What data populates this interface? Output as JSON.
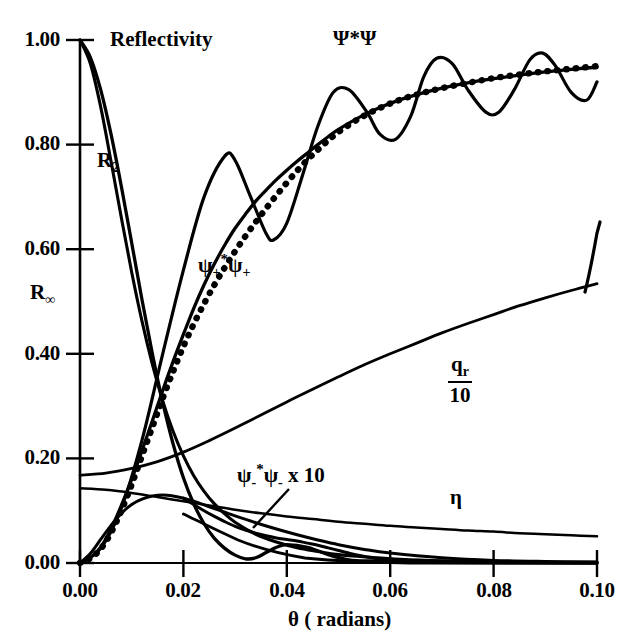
{
  "figure": {
    "background": "#ffffff",
    "ink": "#000000"
  },
  "axes": {
    "y_title": "Reflectivity",
    "x_title": "θ ( radians)",
    "y_ticks": [
      "0.00",
      "0.20",
      "0.40",
      "0.60",
      "0.80",
      "1.00"
    ],
    "x_ticks": [
      "0.00",
      "0.02",
      "0.04",
      "0.06",
      "0.08",
      "0.10"
    ]
  },
  "curve_labels": {
    "psi_star_psi": "Ψ*Ψ",
    "psi_plus": {
      "base1": "ψ",
      "sub1": "+",
      "star": "*",
      "base2": "ψ",
      "sub2": "+"
    },
    "psi_minus": {
      "base1": "ψ",
      "sub1": "-",
      "star": "*",
      "base2": "ψ",
      "sub2": "-",
      "tail": " x 10"
    },
    "r2": {
      "base": "R",
      "sub": "2"
    },
    "rinf": {
      "base": "R",
      "sub": "∞"
    },
    "qr": {
      "num": "q",
      "num_sub": "r",
      "den": "10"
    },
    "eta": "η"
  },
  "chart_data": {
    "type": "line",
    "title": "Reflectivity",
    "xlabel": "θ ( radians)",
    "ylabel": "Reflectivity",
    "xlim": [
      0.0,
      0.1
    ],
    "ylim": [
      0.0,
      1.0
    ],
    "xticks": [
      0.0,
      0.02,
      0.04,
      0.06,
      0.08,
      0.1
    ],
    "yticks": [
      0.0,
      0.2,
      0.4,
      0.6,
      0.8,
      1.0
    ],
    "grid": false,
    "legend": "inline-annotations",
    "series": [
      {
        "name": "R_2",
        "style": "solid",
        "x": [
          0.0,
          0.002,
          0.004,
          0.006,
          0.008,
          0.01,
          0.012,
          0.014,
          0.016,
          0.018,
          0.02,
          0.022,
          0.024,
          0.026,
          0.028,
          0.03,
          0.032,
          0.034,
          0.036,
          0.038,
          0.04,
          0.044,
          0.048,
          0.052,
          0.056,
          0.06,
          0.07,
          0.08,
          0.09,
          0.1
        ],
        "y": [
          1.0,
          0.967,
          0.905,
          0.82,
          0.72,
          0.612,
          0.503,
          0.4,
          0.307,
          0.228,
          0.163,
          0.113,
          0.075,
          0.047,
          0.028,
          0.015,
          0.008,
          0.01,
          0.02,
          0.03,
          0.035,
          0.03,
          0.016,
          0.006,
          0.004,
          0.005,
          0.003,
          0.002,
          0.001,
          0.001
        ]
      },
      {
        "name": "R_infinity",
        "style": "solid",
        "x": [
          0.0,
          0.002,
          0.004,
          0.006,
          0.008,
          0.01,
          0.012,
          0.014,
          0.016,
          0.018,
          0.02,
          0.022,
          0.024,
          0.026,
          0.028,
          0.03,
          0.034,
          0.038,
          0.042,
          0.046,
          0.05,
          0.056,
          0.062,
          0.07,
          0.08,
          0.09,
          0.1
        ],
        "y": [
          1.0,
          0.955,
          0.872,
          0.768,
          0.66,
          0.556,
          0.462,
          0.38,
          0.31,
          0.252,
          0.205,
          0.167,
          0.137,
          0.113,
          0.094,
          0.078,
          0.055,
          0.04,
          0.029,
          0.022,
          0.016,
          0.011,
          0.007,
          0.004,
          0.002,
          0.001,
          0.001
        ]
      },
      {
        "name": "psi_plus_star_psi_plus_solid",
        "style": "solid",
        "x": [
          0.0,
          0.002,
          0.004,
          0.006,
          0.008,
          0.01,
          0.012,
          0.014,
          0.016,
          0.018,
          0.02,
          0.022,
          0.024,
          0.026,
          0.028,
          0.03,
          0.032,
          0.034,
          0.036,
          0.038,
          0.04,
          0.042,
          0.044,
          0.046,
          0.048,
          0.05,
          0.054,
          0.058,
          0.062,
          0.066,
          0.07,
          0.075,
          0.08,
          0.085,
          0.09,
          0.095,
          0.1
        ],
        "y": [
          0.0,
          0.01,
          0.03,
          0.065,
          0.11,
          0.16,
          0.215,
          0.272,
          0.33,
          0.385,
          0.437,
          0.487,
          0.532,
          0.572,
          0.608,
          0.64,
          0.667,
          0.692,
          0.713,
          0.733,
          0.751,
          0.768,
          0.784,
          0.8,
          0.815,
          0.829,
          0.852,
          0.871,
          0.886,
          0.898,
          0.908,
          0.918,
          0.926,
          0.933,
          0.939,
          0.944,
          0.948
        ]
      },
      {
        "name": "psi_plus_star_psi_plus_dotted",
        "style": "dotted",
        "x": [
          0.0,
          0.002,
          0.004,
          0.006,
          0.008,
          0.01,
          0.012,
          0.014,
          0.016,
          0.018,
          0.02,
          0.022,
          0.024,
          0.026,
          0.028,
          0.03,
          0.032,
          0.034,
          0.036,
          0.038,
          0.04,
          0.042,
          0.044,
          0.046,
          0.048,
          0.05,
          0.054,
          0.058,
          0.062,
          0.066,
          0.07,
          0.075,
          0.08,
          0.085,
          0.09,
          0.095,
          0.1
        ],
        "y": [
          0.0,
          0.009,
          0.027,
          0.058,
          0.1,
          0.15,
          0.205,
          0.26,
          0.315,
          0.366,
          0.414,
          0.457,
          0.496,
          0.532,
          0.565,
          0.596,
          0.625,
          0.652,
          0.678,
          0.703,
          0.727,
          0.75,
          0.771,
          0.79,
          0.808,
          0.824,
          0.85,
          0.87,
          0.886,
          0.898,
          0.908,
          0.918,
          0.927,
          0.934,
          0.94,
          0.945,
          0.95
        ]
      },
      {
        "name": "Psi_star_Psi",
        "style": "solid-oscillating",
        "x": [
          0.0,
          0.004,
          0.008,
          0.012,
          0.016,
          0.02,
          0.024,
          0.028,
          0.03,
          0.033,
          0.036,
          0.0375,
          0.04,
          0.043,
          0.046,
          0.049,
          0.052,
          0.0555,
          0.058,
          0.061,
          0.064,
          0.0665,
          0.069,
          0.072,
          0.075,
          0.0785,
          0.081,
          0.084,
          0.087,
          0.0895,
          0.092,
          0.095,
          0.098,
          0.1
        ],
        "y": [
          0.0,
          0.028,
          0.105,
          0.235,
          0.4,
          0.56,
          0.7,
          0.778,
          0.77,
          0.7,
          0.63,
          0.618,
          0.65,
          0.74,
          0.835,
          0.9,
          0.905,
          0.862,
          0.82,
          0.81,
          0.855,
          0.93,
          0.965,
          0.955,
          0.905,
          0.862,
          0.862,
          0.905,
          0.962,
          0.975,
          0.95,
          0.9,
          0.885,
          0.92
        ]
      },
      {
        "name": "q_r/10",
        "style": "solid",
        "x": [
          0.0,
          0.005,
          0.01,
          0.015,
          0.02,
          0.025,
          0.03,
          0.035,
          0.04,
          0.045,
          0.05,
          0.055,
          0.06,
          0.065,
          0.07,
          0.075,
          0.08,
          0.085,
          0.09,
          0.095,
          0.1
        ],
        "y": [
          0.168,
          0.172,
          0.181,
          0.194,
          0.212,
          0.234,
          0.258,
          0.283,
          0.308,
          0.332,
          0.356,
          0.379,
          0.4,
          0.42,
          0.44,
          0.458,
          0.475,
          0.492,
          0.507,
          0.521,
          0.534
        ]
      },
      {
        "name": "eta",
        "style": "solid",
        "x": [
          0.0,
          0.005,
          0.01,
          0.015,
          0.02,
          0.025,
          0.03,
          0.035,
          0.04,
          0.045,
          0.05,
          0.055,
          0.06,
          0.065,
          0.07,
          0.075,
          0.08,
          0.085,
          0.09,
          0.095,
          0.1
        ],
        "y": [
          0.143,
          0.14,
          0.134,
          0.126,
          0.118,
          0.11,
          0.102,
          0.095,
          0.089,
          0.084,
          0.079,
          0.075,
          0.071,
          0.068,
          0.065,
          0.062,
          0.06,
          0.057,
          0.055,
          0.053,
          0.051
        ]
      },
      {
        "name": "psi_minus_star_psi_minus_x10",
        "style": "solid",
        "x": [
          0.0,
          0.002,
          0.004,
          0.006,
          0.008,
          0.01,
          0.012,
          0.014,
          0.016,
          0.018,
          0.02,
          0.022,
          0.024,
          0.026,
          0.028,
          0.03,
          0.034,
          0.038,
          0.042,
          0.046,
          0.05,
          0.055,
          0.06,
          0.07,
          0.08,
          0.09,
          0.1
        ],
        "y": [
          0.0,
          0.018,
          0.045,
          0.072,
          0.095,
          0.112,
          0.122,
          0.128,
          0.13,
          0.128,
          0.124,
          0.118,
          0.111,
          0.104,
          0.097,
          0.09,
          0.077,
          0.065,
          0.054,
          0.044,
          0.035,
          0.026,
          0.019,
          0.01,
          0.005,
          0.003,
          0.002
        ]
      },
      {
        "name": "psi_minus_secondary_lobe",
        "style": "solid",
        "x": [
          0.02,
          0.022,
          0.024,
          0.026,
          0.028,
          0.03,
          0.032,
          0.034,
          0.036,
          0.038,
          0.04,
          0.042,
          0.044,
          0.046,
          0.048,
          0.05,
          0.052,
          0.056,
          0.06,
          0.07,
          0.08,
          0.09,
          0.1
        ],
        "y": [
          0.124,
          0.112,
          0.1,
          0.089,
          0.079,
          0.07,
          0.063,
          0.057,
          0.052,
          0.048,
          0.045,
          0.042,
          0.038,
          0.034,
          0.029,
          0.024,
          0.019,
          0.011,
          0.006,
          0.002,
          0.001,
          0.001,
          0.0
        ]
      }
    ],
    "annotations": [
      {
        "text": "Ψ*Ψ",
        "x": 0.052,
        "y": 0.975
      },
      {
        "text": "ψ+*ψ+",
        "x": 0.03,
        "y": 0.545
      },
      {
        "text": "ψ-*ψ- x 10",
        "x": 0.036,
        "y": 0.135
      },
      {
        "text": "R2",
        "x": 0.008,
        "y": 0.755
      },
      {
        "text": "R∞",
        "x": 0.002,
        "y": 0.455
      },
      {
        "text": "q_r/10",
        "x": 0.083,
        "y": 0.345
      },
      {
        "text": "η",
        "x": 0.09,
        "y": 0.095
      },
      {
        "text": "Reflectivity",
        "x": 0.012,
        "y": 1.0
      }
    ]
  }
}
